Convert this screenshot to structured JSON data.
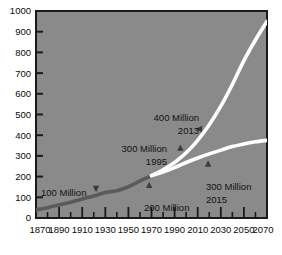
{
  "chart_data": {
    "type": "line",
    "title": "",
    "xlabel": "",
    "ylabel": "",
    "xlim": [
      1870,
      2070
    ],
    "ylim": [
      0,
      1000
    ],
    "grid": false,
    "legend": "none",
    "x_ticks": [
      1870,
      1890,
      1910,
      1930,
      1950,
      1970,
      1990,
      2010,
      2030,
      2050,
      2070
    ],
    "x_minor_ticks": [
      1880,
      1900,
      1920,
      1940,
      1960,
      1980,
      2000,
      2020,
      2040,
      2060
    ],
    "y_ticks": [
      0,
      100,
      200,
      300,
      400,
      500,
      600,
      700,
      800,
      900,
      1000
    ],
    "series": [
      {
        "name": "Historical",
        "style": "dark-gray-solid",
        "color": "#5a5a5a",
        "x": [
          1870,
          1880,
          1890,
          1900,
          1910,
          1920,
          1930,
          1940,
          1950,
          1960,
          1970
        ],
        "values": [
          40,
          50,
          63,
          76,
          92,
          106,
          123,
          132,
          151,
          179,
          205
        ]
      },
      {
        "name": "High projection",
        "style": "white-solid",
        "color": "#ffffff",
        "x": [
          1970,
          1980,
          1990,
          2000,
          2010,
          2020,
          2030,
          2040,
          2050,
          2060,
          2070
        ],
        "values": [
          205,
          233,
          268,
          315,
          375,
          450,
          540,
          645,
          760,
          860,
          950
        ]
      },
      {
        "name": "Low projection",
        "style": "white-solid",
        "color": "#ffffff",
        "x": [
          1970,
          1980,
          1990,
          2000,
          2010,
          2020,
          2030,
          2040,
          2050,
          2060,
          2070
        ],
        "values": [
          205,
          222,
          243,
          268,
          290,
          310,
          328,
          345,
          358,
          368,
          375
        ]
      }
    ],
    "annotations": [
      {
        "id": "milestone-100-million",
        "line1": "100  Million",
        "line2": "",
        "marker": "down-triangle",
        "marker_x": 1922,
        "marker_y": 140
      },
      {
        "id": "milestone-200-million",
        "line1": "200  Million",
        "line2": "",
        "marker": "up-triangle",
        "marker_x": 1968,
        "marker_y": 160
      },
      {
        "id": "milestone-300-million-1995",
        "line1": "300  Million",
        "line2": "1995",
        "marker": "up-triangle",
        "marker_x": 1995,
        "marker_y": 340
      },
      {
        "id": "milestone-400-million-2013",
        "line1": "400  Million",
        "line2": "2013",
        "marker": "left-triangle",
        "marker_x": 2011,
        "marker_y": 430
      },
      {
        "id": "milestone-300-million-2015",
        "line1": "300  Million",
        "line2": "2015",
        "marker": "up-triangle",
        "marker_x": 2019,
        "marker_y": 263
      }
    ]
  },
  "colors": {
    "plot_background": "#8a8a8a",
    "historical_line": "#5a5a5a",
    "projection_line": "#ffffff",
    "axis": "#1a1a1a",
    "text": "#111111",
    "page_background": "#ffffff"
  },
  "axis_labels": {
    "y": [
      "1000",
      "900",
      "800",
      "700",
      "600",
      "500",
      "400",
      "300",
      "200",
      "100",
      "0"
    ],
    "x": [
      "1870",
      "1890",
      "1910",
      "1930",
      "1950",
      "1970",
      "1990",
      "2010",
      "2030",
      "2050",
      "2070"
    ]
  },
  "annotation_text": {
    "a100_l1": "100  Million",
    "a200_l1": "200  Million",
    "a300a_l1": "300  Million",
    "a300a_l2": "1995",
    "a400_l1": "400  Million",
    "a400_l2": "2013",
    "a300b_l1": "300  Million",
    "a300b_l2": "2015"
  }
}
